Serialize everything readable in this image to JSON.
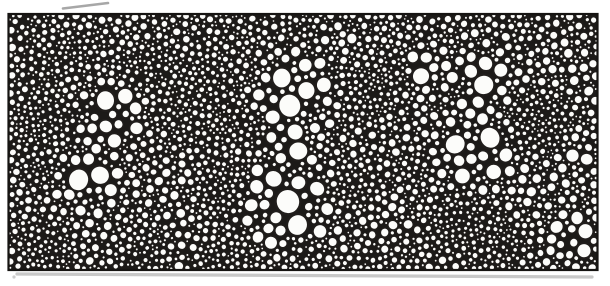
{
  "figure": {
    "canvas": {
      "width": 610,
      "height": 286
    },
    "frame": {
      "x": 8.5,
      "y": 14,
      "w": 589,
      "h": 256,
      "border_width": 2.2
    },
    "palette": {
      "paper": "#ffffff",
      "ink_web": "#1c1a18",
      "circle_stroke": "#201d1b",
      "circle_fill": "#fcfcfa",
      "border_ink": "#161412",
      "shadow_gray": "#9b9b9b",
      "pencil_gray": "#8a8a8a"
    },
    "packing": {
      "seed": 1337,
      "attempts": 52000,
      "gap": 0.8,
      "r_absolute_min": 1.3,
      "r_accept_fraction": 0.25,
      "r_clamp_min": 1.45,
      "r_clamp_max": 13.2,
      "grid_cell": 14,
      "noise": {
        "cell": 44,
        "r_lo": 2.4,
        "r_hi": 6.8,
        "exp": 1.4,
        "octave2_scale": 2.3,
        "octave1_weight": 0.65,
        "octave2_weight": 0.35
      },
      "edge": {
        "band": 16,
        "cap_base": 4.0,
        "cap_slope": 0.45
      },
      "stroke": {
        "base": 0.8,
        "slope": 0.16,
        "min": 1.0,
        "max": 2.5
      },
      "squash": 0.09
    },
    "large_cell_regions": [
      {
        "x": 112,
        "y": 115,
        "r": 42,
        "size": 13.0
      },
      {
        "x": 88,
        "y": 178,
        "r": 40,
        "size": 11.5
      },
      {
        "x": 295,
        "y": 95,
        "r": 52,
        "size": 12.5
      },
      {
        "x": 288,
        "y": 150,
        "r": 30,
        "size": 11.0
      },
      {
        "x": 288,
        "y": 208,
        "r": 60,
        "size": 13.0
      },
      {
        "x": 428,
        "y": 70,
        "r": 32,
        "size": 10.0
      },
      {
        "x": 482,
        "y": 82,
        "r": 40,
        "size": 10.5
      },
      {
        "x": 475,
        "y": 150,
        "r": 46,
        "size": 13.0
      },
      {
        "x": 575,
        "y": 238,
        "r": 34,
        "size": 9.5
      },
      {
        "x": 585,
        "y": 150,
        "r": 30,
        "size": 8.5
      }
    ],
    "fine_cell_regions": [
      {
        "x": 42,
        "y": 115,
        "r": 45,
        "size": 2.1
      },
      {
        "x": 72,
        "y": 52,
        "r": 30,
        "size": 2.2
      },
      {
        "x": 40,
        "y": 170,
        "r": 32,
        "size": 2.1
      },
      {
        "x": 52,
        "y": 250,
        "r": 55,
        "size": 2.1
      },
      {
        "x": 150,
        "y": 245,
        "r": 36,
        "size": 2.3
      },
      {
        "x": 215,
        "y": 262,
        "r": 26,
        "size": 2.3
      },
      {
        "x": 160,
        "y": 55,
        "r": 30,
        "size": 2.3
      },
      {
        "x": 200,
        "y": 70,
        "r": 36,
        "size": 2.4
      },
      {
        "x": 235,
        "y": 120,
        "r": 32,
        "size": 2.5
      },
      {
        "x": 222,
        "y": 185,
        "r": 46,
        "size": 2.3
      },
      {
        "x": 305,
        "y": 30,
        "r": 26,
        "size": 2.4
      },
      {
        "x": 372,
        "y": 92,
        "r": 48,
        "size": 2.1
      },
      {
        "x": 355,
        "y": 190,
        "r": 38,
        "size": 2.3
      },
      {
        "x": 305,
        "y": 256,
        "r": 26,
        "size": 2.4
      },
      {
        "x": 360,
        "y": 262,
        "r": 34,
        "size": 2.8
      },
      {
        "x": 408,
        "y": 256,
        "r": 34,
        "size": 2.8
      },
      {
        "x": 418,
        "y": 175,
        "r": 30,
        "size": 2.4
      },
      {
        "x": 545,
        "y": 113,
        "r": 50,
        "size": 2.1
      },
      {
        "x": 458,
        "y": 225,
        "r": 45,
        "size": 2.1
      },
      {
        "x": 510,
        "y": 246,
        "r": 38,
        "size": 2.2
      }
    ],
    "artifacts": {
      "pencil_stroke": {
        "x1": 63,
        "y1": 8.5,
        "x2": 108,
        "y2": 3,
        "width": 2.6,
        "alpha": 0.75
      },
      "bottom_shadow": {
        "x1": 17,
        "y1": 274,
        "x2": 592,
        "y2": 277,
        "width": 3.2,
        "alpha": 0.55
      },
      "bottom_left_dot": {
        "x": 14,
        "y": 277,
        "r": 1.6,
        "alpha": 0.5
      }
    }
  }
}
